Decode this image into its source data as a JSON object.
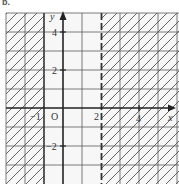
{
  "figure": {
    "part_label": "b.",
    "colors": {
      "background": "#f7f7f7",
      "grid": "#555555",
      "axis": "#222222",
      "hatch": "#555555",
      "boundary": "#333333"
    }
  },
  "axes": {
    "x_label": "x",
    "y_label": "y",
    "origin_label": "O",
    "x_ticks": [
      {
        "value": -1,
        "label": "−1"
      },
      {
        "value": 2,
        "label": "2"
      },
      {
        "value": 4,
        "label": "4"
      }
    ],
    "y_ticks": [
      {
        "value": 4,
        "label": "4"
      },
      {
        "value": 2,
        "label": "2"
      },
      {
        "value": -2,
        "label": "−2"
      }
    ],
    "x_range": [
      -3,
      6
    ],
    "y_range": [
      -3,
      5
    ]
  },
  "regions": [
    {
      "name": "left-shaded",
      "inequality": "x ≤ -1",
      "boundary": "solid",
      "boundary_x": -1
    },
    {
      "name": "right-shaded",
      "inequality": "x > 2",
      "boundary": "dashed",
      "boundary_x": 2
    }
  ]
}
